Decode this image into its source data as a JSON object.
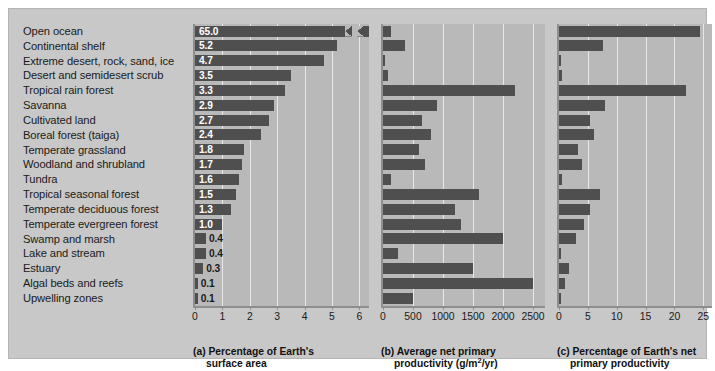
{
  "figure": {
    "biomes": [
      "Open ocean",
      "Continental shelf",
      "Extreme desert, rock, sand, ice",
      "Desert and semidesert scrub",
      "Tropical rain forest",
      "Savanna",
      "Cultivated land",
      "Boreal forest (taiga)",
      "Temperate grassland",
      "Woodland and shrubland",
      "Tundra",
      "Tropical seasonal forest",
      "Temperate deciduous forest",
      "Temperate evergreen forest",
      "Swamp and marsh",
      "Lake and stream",
      "Estuary",
      "Algal beds and reefs",
      "Upwelling zones"
    ],
    "colors": {
      "bar": "#4f4f4f",
      "plot_background": "#b9b9b9",
      "figure_background": "#c8c8c8",
      "gridline": "#e8e8e8",
      "value_label": "#ffffff",
      "text": "#1a1a1a"
    }
  },
  "chart_data": [
    {
      "type": "bar",
      "id": "a",
      "title": "(a) Percentage of Earth's",
      "title_line2": "surface area",
      "orientation": "horizontal",
      "xlabel": "",
      "ylabel": "",
      "xlim": [
        0,
        6.35
      ],
      "ticks": [
        "0",
        "1",
        "2",
        "3",
        "4",
        "5",
        "6"
      ],
      "tick_values": [
        0,
        1,
        2,
        3,
        4,
        5,
        6
      ],
      "grid": true,
      "axis_break": true,
      "axis_break_note": "Open ocean bar (65.0) is broken; axis maximum is about 6",
      "categories": [
        "Open ocean",
        "Continental shelf",
        "Extreme desert, rock, sand, ice",
        "Desert and semidesert scrub",
        "Tropical rain forest",
        "Savanna",
        "Cultivated land",
        "Boreal forest (taiga)",
        "Temperate grassland",
        "Woodland and shrubland",
        "Tundra",
        "Tropical seasonal forest",
        "Temperate deciduous forest",
        "Temperate evergreen forest",
        "Swamp and marsh",
        "Lake and stream",
        "Estuary",
        "Algal beds and reefs",
        "Upwelling zones"
      ],
      "values": [
        65.0,
        5.2,
        4.7,
        3.5,
        3.3,
        2.9,
        2.7,
        2.4,
        1.8,
        1.7,
        1.6,
        1.5,
        1.3,
        1.0,
        0.4,
        0.4,
        0.3,
        0.1,
        0.1
      ],
      "data_labels": [
        "65.0",
        "5.2",
        "4.7",
        "3.5",
        "3.3",
        "2.9",
        "2.7",
        "2.4",
        "1.8",
        "1.7",
        "1.6",
        "1.5",
        "1.3",
        "1.0",
        "0.4",
        "0.4",
        "0.3",
        "0.1",
        "0.1"
      ]
    },
    {
      "type": "bar",
      "id": "b",
      "title": "(b) Average net primary",
      "title_line2": "productivity (g/m2/yr)",
      "title_line2_pre": "productivity (g/m",
      "title_line2_sup": "2",
      "title_line2_post": "/yr)",
      "orientation": "horizontal",
      "xlabel": "",
      "ylabel": "",
      "xlim": [
        0,
        2700
      ],
      "ticks": [
        "0",
        "500",
        "1000",
        "1500",
        "2000",
        "2500"
      ],
      "tick_values": [
        0,
        500,
        1000,
        1500,
        2000,
        2500
      ],
      "grid": true,
      "categories": [
        "Open ocean",
        "Continental shelf",
        "Extreme desert, rock, sand, ice",
        "Desert and semidesert scrub",
        "Tropical rain forest",
        "Savanna",
        "Cultivated land",
        "Boreal forest (taiga)",
        "Temperate grassland",
        "Woodland and shrubland",
        "Tundra",
        "Tropical seasonal forest",
        "Temperate deciduous forest",
        "Temperate evergreen forest",
        "Swamp and marsh",
        "Lake and stream",
        "Estuary",
        "Algal beds and reefs",
        "Upwelling zones"
      ],
      "values": [
        125,
        360,
        3,
        90,
        2200,
        900,
        650,
        800,
        600,
        700,
        140,
        1600,
        1200,
        1300,
        2000,
        250,
        1500,
        2500,
        500
      ]
    },
    {
      "type": "bar",
      "id": "c",
      "title": "(c) Percentage of Earth's net",
      "title_line2": "primary productivity",
      "orientation": "horizontal",
      "xlabel": "",
      "ylabel": "",
      "xlim": [
        0,
        26.5
      ],
      "ticks": [
        "0",
        "5",
        "10",
        "15",
        "20",
        "25"
      ],
      "tick_values": [
        0,
        5,
        10,
        15,
        20,
        25
      ],
      "grid": true,
      "categories": [
        "Open ocean",
        "Continental shelf",
        "Extreme desert, rock, sand, ice",
        "Desert and semidesert scrub",
        "Tropical rain forest",
        "Savanna",
        "Cultivated land",
        "Boreal forest (taiga)",
        "Temperate grassland",
        "Woodland and shrubland",
        "Tundra",
        "Tropical seasonal forest",
        "Temperate deciduous forest",
        "Temperate evergreen forest",
        "Swamp and marsh",
        "Lake and stream",
        "Estuary",
        "Algal beds and reefs",
        "Upwelling zones"
      ],
      "values": [
        24.4,
        7.7,
        0.1,
        0.6,
        22.0,
        7.9,
        5.4,
        6.0,
        3.3,
        3.9,
        0.5,
        7.1,
        5.4,
        4.3,
        2.9,
        0.3,
        1.7,
        1.0,
        0.3
      ]
    }
  ]
}
